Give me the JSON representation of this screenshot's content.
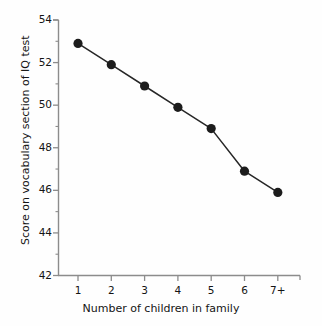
{
  "chart_data": {
    "type": "line",
    "title": "",
    "subtitle": "",
    "xlabel": "Number of children in family",
    "ylabel": "Score on vocabulary section of IQ test",
    "categories": [
      "1",
      "2",
      "3",
      "4",
      "5",
      "6",
      "7+"
    ],
    "values": [
      52.9,
      51.9,
      50.9,
      49.9,
      48.9,
      46.9,
      45.9
    ],
    "series": [
      {
        "name": "Vocabulary score",
        "values": [
          52.9,
          51.9,
          50.9,
          49.9,
          48.9,
          46.9,
          45.9
        ]
      }
    ],
    "ylim": [
      42,
      54
    ],
    "xlim": [
      0,
      8
    ],
    "y_major_ticks": [
      42,
      44,
      46,
      48,
      50,
      52,
      54
    ],
    "y_minor_ticks": [
      43,
      45,
      47,
      49,
      51,
      53
    ],
    "y_tick_labels": [
      "42",
      "44",
      "46",
      "48",
      "50",
      "52",
      "54"
    ],
    "x_tick_labels": [
      "1",
      "2",
      "3",
      "4",
      "5",
      "6",
      "7+"
    ],
    "grid": false,
    "legend": "none",
    "marker": "filled-circle",
    "line_color": "#262626",
    "marker_color": "#1c1c1c",
    "axis_color": "#8c8c8c",
    "background_color": "#fefefe",
    "annotations": []
  },
  "axes": {
    "y_title": "Score on vocabulary section of IQ test",
    "x_title": "Number of children in family"
  }
}
